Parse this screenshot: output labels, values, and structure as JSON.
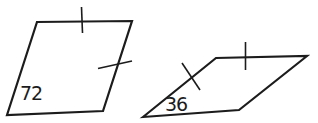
{
  "figure": {
    "background": "#ffffff",
    "stroke_color": "#1c1c1c",
    "outline_width": 2.2,
    "tick_width": 1.6,
    "label_font_size": 19,
    "shapes": [
      {
        "name": "parallelogram-left",
        "label": "72",
        "label_pos": [
          20,
          100
        ],
        "vertices": [
          [
            7,
            115
          ],
          [
            37,
            22
          ],
          [
            132,
            21
          ],
          [
            103,
            111
          ]
        ],
        "ticks": [
          {
            "x1": 81.5,
            "y1": 7,
            "x2": 82.5,
            "y2": 33
          },
          {
            "x1": 98,
            "y1": 68.5,
            "x2": 132,
            "y2": 61
          }
        ]
      },
      {
        "name": "parallelogram-right",
        "label": "36",
        "label_pos": [
          165,
          111
        ],
        "vertices": [
          [
            143,
            117
          ],
          [
            216,
            58
          ],
          [
            307,
            56
          ],
          [
            239,
            110
          ]
        ],
        "ticks": [
          {
            "x1": 182,
            "y1": 63,
            "x2": 200,
            "y2": 90
          },
          {
            "x1": 245.5,
            "y1": 42,
            "x2": 245.5,
            "y2": 70
          }
        ]
      }
    ]
  }
}
